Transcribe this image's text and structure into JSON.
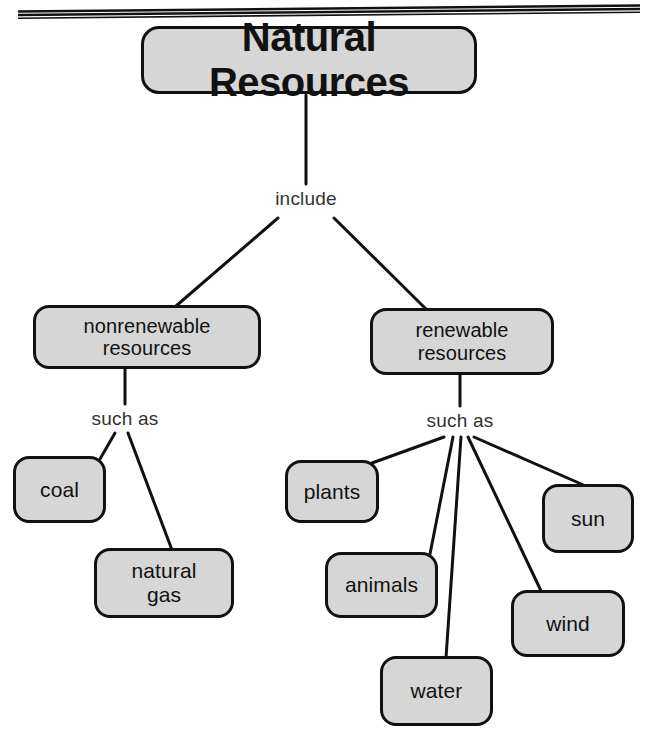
{
  "diagram": {
    "type": "concept-map",
    "title": "Natural Resources",
    "root": {
      "label": "Natural Resources",
      "x": 141,
      "y": 26,
      "w": 336,
      "h": 68
    },
    "connector_labels": [
      {
        "name": "include",
        "text": "include",
        "x": 306,
        "y": 199
      },
      {
        "name": "such-as-left",
        "text": "such as",
        "x": 125,
        "y": 419
      },
      {
        "name": "such-as-right",
        "text": "such as",
        "x": 460,
        "y": 421
      }
    ],
    "branches": [
      {
        "id": "nonrenewable",
        "label": "nonrenewable\nresources",
        "x": 33,
        "y": 305,
        "w": 228,
        "h": 64,
        "children": [
          {
            "id": "coal",
            "label": "coal",
            "x": 13,
            "y": 456,
            "w": 93,
            "h": 67
          },
          {
            "id": "natural-gas",
            "label": "natural\ngas",
            "x": 94,
            "y": 548,
            "w": 140,
            "h": 70
          }
        ]
      },
      {
        "id": "renewable",
        "label": "renewable\nresources",
        "x": 370,
        "y": 308,
        "w": 184,
        "h": 67,
        "children": [
          {
            "id": "plants",
            "label": "plants",
            "x": 285,
            "y": 460,
            "w": 94,
            "h": 63
          },
          {
            "id": "animals",
            "label": "animals",
            "x": 325,
            "y": 552,
            "w": 113,
            "h": 66
          },
          {
            "id": "water",
            "label": "water",
            "x": 380,
            "y": 656,
            "w": 113,
            "h": 70
          },
          {
            "id": "wind",
            "label": "wind",
            "x": 511,
            "y": 590,
            "w": 114,
            "h": 67
          },
          {
            "id": "sun",
            "label": "sun",
            "x": 542,
            "y": 484,
            "w": 92,
            "h": 69
          }
        ]
      }
    ],
    "colors": {
      "node_fill": "#d6d6d6",
      "node_border": "#111111",
      "line": "#111111",
      "text": "#111111",
      "label_text": "#333333",
      "background": "#ffffff"
    }
  }
}
